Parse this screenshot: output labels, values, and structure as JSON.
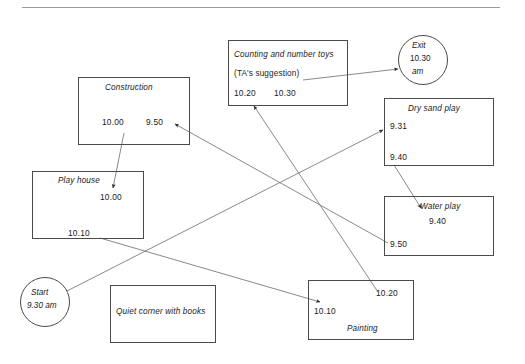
{
  "page": {
    "has_top_rule": true,
    "line_color": "#4a4a4a",
    "text_color": "#1b1b1b"
  },
  "nodes": {
    "construction": {
      "label": "Construction",
      "times": [
        "10.00",
        "9.50"
      ]
    },
    "counting": {
      "label": "Counting and number toys",
      "sub_label": "(TA's suggestion)",
      "times": [
        "10.20",
        "10.30"
      ]
    },
    "exit": {
      "line1": "Exit",
      "line2": "10.30",
      "line3": "am"
    },
    "dry_sand": {
      "label": "Dry sand play",
      "times": [
        "9.31",
        "9.40"
      ]
    },
    "water_play": {
      "label": "Water play",
      "times": [
        "9.40",
        "9.50"
      ]
    },
    "play_house": {
      "label": "Play house",
      "times": [
        "10.00",
        "10.10"
      ]
    },
    "start": {
      "line1": "Start",
      "line2": "9.30 am"
    },
    "quiet_corner": {
      "label": "Quiet corner with books",
      "times": []
    },
    "painting": {
      "label": "Painting",
      "times": [
        "10.20",
        "10.10"
      ]
    }
  },
  "connections": [
    {
      "name": "start-to-dry-sand",
      "from": "start",
      "to": "dry_sand",
      "time": "9.31"
    },
    {
      "name": "dry-sand-to-water-play",
      "from": "dry_sand",
      "to": "water_play",
      "time": "9.40"
    },
    {
      "name": "water-play-to-construction",
      "from": "water_play",
      "to": "construction",
      "time": "9.50"
    },
    {
      "name": "construction-to-play-house",
      "from": "construction",
      "to": "play_house",
      "time": "10.00"
    },
    {
      "name": "play-house-to-painting",
      "from": "play_house",
      "to": "painting",
      "time": "10.10"
    },
    {
      "name": "painting-to-counting",
      "from": "painting",
      "to": "counting",
      "time": "10.20"
    },
    {
      "name": "counting-to-exit",
      "from": "counting",
      "to": "exit",
      "time": "10.30"
    }
  ]
}
